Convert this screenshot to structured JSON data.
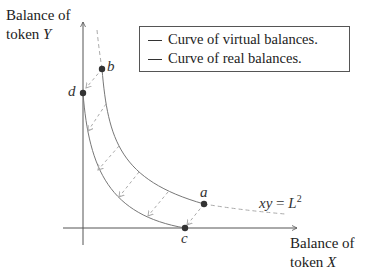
{
  "diagram": {
    "y_axis_label": {
      "line1": "Balance of",
      "line2_prefix": "token ",
      "line2_var": "Y"
    },
    "x_axis_label": {
      "line1": "Balance of",
      "line2_prefix": "token ",
      "line2_var": "X"
    },
    "legend": {
      "items": [
        {
          "label": "Curve of virtual balances."
        },
        {
          "label": "Curve of real balances."
        }
      ]
    },
    "points": [
      {
        "name": "a"
      },
      {
        "name": "b"
      },
      {
        "name": "c"
      },
      {
        "name": "d"
      }
    ],
    "equation": {
      "lhs": "xy",
      "eq": " = ",
      "rhs": "L",
      "exp": "2"
    },
    "colors": {
      "curve": "#777777",
      "dashed": "#aaaaaa",
      "axis": "#555555",
      "point": "#333333"
    }
  }
}
